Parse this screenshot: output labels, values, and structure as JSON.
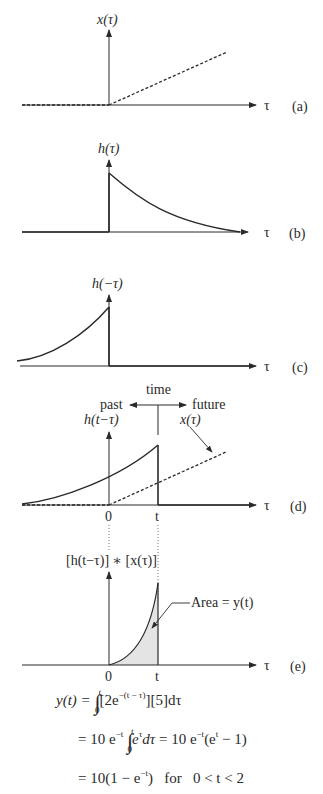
{
  "figure": {
    "axis_symbol": "τ",
    "panels": [
      {
        "id": "a",
        "tag": "(a)",
        "ylabel": "x(τ)",
        "description": "input x(τ): zero for τ<0, ramp for τ>0 (dashed)"
      },
      {
        "id": "b",
        "tag": "(b)",
        "ylabel": "h(τ)",
        "description": "impulse response h(τ): decaying exponential starting at τ=0"
      },
      {
        "id": "c",
        "tag": "(c)",
        "ylabel": "h(−τ)",
        "description": "time-reversed h(−τ): rising exponential ending at τ=0"
      },
      {
        "id": "d",
        "tag": "(d)",
        "ylabel": "h(t−τ)",
        "second_label": "x(τ)",
        "tick_0": "0",
        "tick_t": "t",
        "time_label": "time",
        "past_label": "past",
        "future_label": "future",
        "description": "shifted h(t−τ) overlaid with dashed x(τ)"
      },
      {
        "id": "e",
        "tag": "(e)",
        "ylabel": "[h(t−τ)] ∗ [x(τ)]",
        "tick_0": "0",
        "tick_t": "t",
        "annotation": "Area = y(t)",
        "description": "product, shaded area between 0 and t"
      }
    ]
  },
  "equations": {
    "line1": {
      "lhs": "y(t) =",
      "integrand": "[2e",
      "exp": "−(t − τ)",
      "rest": "][5]dτ",
      "upper": "t",
      "lower": "0"
    },
    "line2": {
      "prefix": "= 10 e",
      "exp1": "−t",
      "integrand": "e",
      "exp2": "τ",
      "d": "dτ",
      "mid": " = 10 e",
      "exp3": "−t",
      "paren": "(e",
      "exp4": "t",
      "tail": " − 1)",
      "upper": "t",
      "lower": "0"
    },
    "line3": {
      "text": "= 10(1 − e",
      "exp": "−t",
      "close": ")",
      "cond": "for",
      "range": "0 < t < 2"
    }
  },
  "colors": {
    "ink": "#2a2a2a",
    "shade": "#e4e4e4"
  }
}
